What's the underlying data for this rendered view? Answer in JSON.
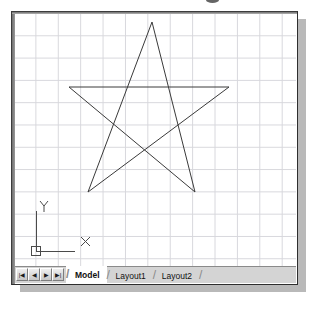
{
  "window": {
    "title": "AutoCAD Drawing Area",
    "background_color": "#ffffff",
    "border_color": "#3c3c3c",
    "shadow_color": "#b9b9b9"
  },
  "canvas": {
    "grid_color": "#d7d7dc",
    "grid_spacing_px": 22,
    "line_color": "#3a3a3a",
    "line_width": 1
  },
  "ucs_icon": {
    "x_label": "X",
    "y_label": "Y",
    "origin_marker": "square"
  },
  "tab_bar": {
    "nav_buttons": [
      {
        "name": "first",
        "glyph": "|◀"
      },
      {
        "name": "previous",
        "glyph": "◀"
      },
      {
        "name": "next",
        "glyph": "▶"
      },
      {
        "name": "last",
        "glyph": "▶|"
      }
    ],
    "tabs": [
      {
        "label": "Model",
        "active": true
      },
      {
        "label": "Layout1",
        "active": false
      },
      {
        "label": "Layout2",
        "active": false
      }
    ]
  },
  "chart_data": {
    "type": "line",
    "xlabel": "",
    "ylabel": "",
    "points": [
      {
        "name": "top",
        "x": 151,
        "y": 21
      },
      {
        "name": "bottom-right",
        "x": 194,
        "y": 191
      },
      {
        "name": "left",
        "x": 68,
        "y": 86
      },
      {
        "name": "right",
        "x": 228,
        "y": 86
      },
      {
        "name": "bottom-left",
        "x": 87,
        "y": 191
      }
    ],
    "closed": true,
    "svg_path": "M 151 21 L 194 191 L 68 86 L 228 86 L 87 191 Z",
    "grid": true,
    "legend": "none"
  }
}
